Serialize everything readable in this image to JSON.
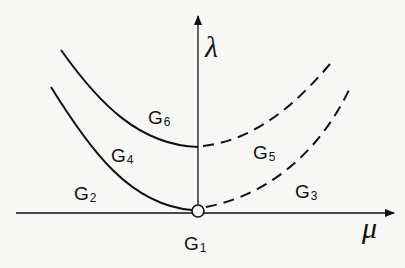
{
  "diagram": {
    "type": "bifurcation-region-diagram",
    "axes": {
      "horizontal": {
        "label": "μ"
      },
      "vertical": {
        "label": "λ"
      }
    },
    "origin_marker": "open-circle",
    "curves": [
      {
        "name": "upper-curve",
        "left_style": "solid",
        "right_style": "dashed"
      },
      {
        "name": "lower-curve",
        "left_style": "solid",
        "right_style": "dashed"
      }
    ],
    "regions": [
      {
        "id": "G1",
        "letter": "G",
        "index": "1"
      },
      {
        "id": "G2",
        "letter": "G",
        "index": "2"
      },
      {
        "id": "G3",
        "letter": "G",
        "index": "3"
      },
      {
        "id": "G4",
        "letter": "G",
        "index": "4"
      },
      {
        "id": "G5",
        "letter": "G",
        "index": "5"
      },
      {
        "id": "G6",
        "letter": "G",
        "index": "6"
      }
    ],
    "colors": {
      "ink": "#111111",
      "background": "#f7f7f5"
    }
  }
}
